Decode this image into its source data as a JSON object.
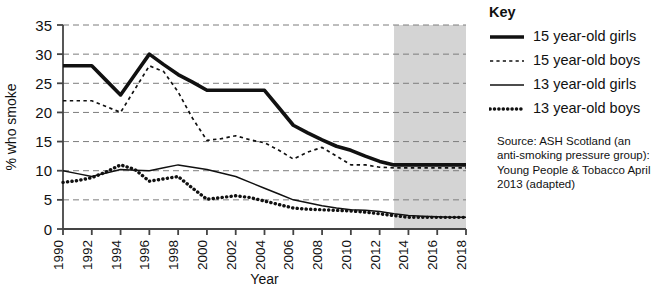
{
  "chart_data": {
    "type": "line",
    "title": "",
    "xlabel": "Year",
    "ylabel": "% who smoke",
    "xlim": [
      1990,
      2018
    ],
    "ylim": [
      0,
      35
    ],
    "yticks": [
      0,
      5,
      10,
      15,
      20,
      25,
      30,
      35
    ],
    "xticks": [
      1990,
      1992,
      1994,
      1996,
      1998,
      2000,
      2002,
      2004,
      2006,
      2008,
      2010,
      2012,
      2014,
      2016,
      2018
    ],
    "grid": true,
    "legend_position": "right",
    "x": [
      1990,
      1991,
      1992,
      1993,
      1994,
      1995,
      1996,
      1997,
      1998,
      1999,
      2000,
      2001,
      2002,
      2003,
      2004,
      2005,
      2006,
      2007,
      2008,
      2009,
      2010,
      2011,
      2012,
      2013,
      2014,
      2015,
      2016,
      2017,
      2018
    ],
    "series": [
      {
        "name": "15 year-old girls",
        "style": "thick-solid",
        "values": [
          28,
          28,
          28,
          25.5,
          23,
          26.5,
          30,
          28.2,
          26.5,
          25.2,
          23.8,
          23.8,
          23.8,
          23.8,
          23.8,
          20.8,
          17.8,
          16.5,
          15.3,
          14.2,
          13.5,
          12.5,
          11.6,
          11,
          11,
          11,
          11,
          11,
          11
        ]
      },
      {
        "name": "15 year-old boys",
        "style": "thin-dashed",
        "values": [
          22,
          22,
          22,
          21,
          20,
          24,
          28,
          27,
          23.5,
          19,
          15.2,
          15.5,
          16,
          15.3,
          14.8,
          13.5,
          12,
          13.2,
          14,
          12.5,
          11,
          11,
          10.6,
          10.5,
          10.5,
          10.5,
          10.5,
          10.5,
          10.5
        ]
      },
      {
        "name": "13 year-old girls",
        "style": "thin-solid",
        "values": [
          10,
          9.5,
          9,
          9.6,
          10.2,
          10.1,
          10,
          10.5,
          11,
          10.6,
          10.2,
          9.6,
          9,
          8,
          7,
          6,
          5,
          4.5,
          4,
          3.6,
          3.3,
          3.2,
          3,
          2.6,
          2.3,
          2.2,
          2.1,
          2,
          2
        ]
      },
      {
        "name": "13 year-old boys",
        "style": "thick-dotted",
        "values": [
          8,
          8.3,
          8.8,
          9.8,
          11,
          10.2,
          8.2,
          8.6,
          9,
          7,
          5.1,
          5.4,
          5.7,
          5.4,
          4.8,
          4.2,
          3.6,
          3.4,
          3.3,
          3.2,
          3.1,
          2.9,
          2.6,
          2.3,
          2,
          2,
          2,
          2,
          2
        ]
      }
    ],
    "shaded_region": {
      "label": "projection",
      "x_start": 2013,
      "x_end": 2018,
      "color": "#d4d4d4"
    }
  },
  "key": {
    "heading": "Key",
    "items": [
      {
        "label": "15 year-old girls",
        "style": "thick-solid"
      },
      {
        "label": "15 year-old boys",
        "style": "thin-dashed"
      },
      {
        "label": "13 year-old girls",
        "style": "thin-solid"
      },
      {
        "label": "13 year-old boys",
        "style": "thick-dotted"
      }
    ]
  },
  "source": {
    "line1": "Source:  ASH Scotland (an",
    "line2": "anti-smoking pressure group):",
    "line3": "Young People & Tobacco April",
    "line4": "2013 (adapted)"
  }
}
